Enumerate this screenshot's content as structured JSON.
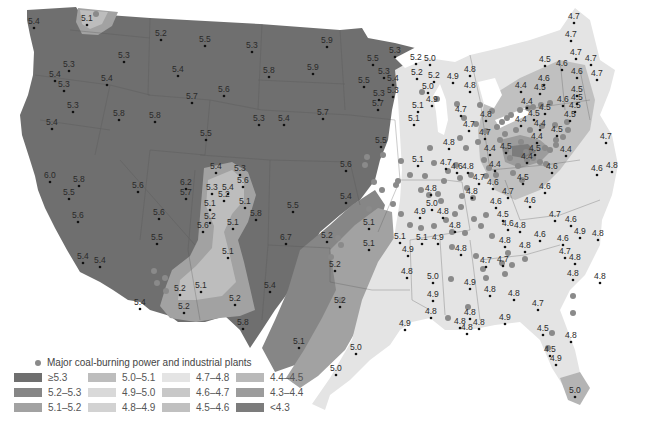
{
  "figure": {
    "type": "choropleth-map"
  },
  "legend": {
    "plant_marker_label": "Major coal-burning power and industrial plants",
    "plant_marker_color": "#8a8a8a",
    "classes": [
      {
        "label": "≥5.3",
        "color": "#6f6f6f"
      },
      {
        "label": "5.2–5.3",
        "color": "#868686"
      },
      {
        "label": "5.1–5.2",
        "color": "#a2a2a2"
      },
      {
        "label": "5.0–5.1",
        "color": "#bdbdbd"
      },
      {
        "label": "4.9–5.0",
        "color": "#d9d9d9"
      },
      {
        "label": "4.8–4.9",
        "color": "#d2d2d2"
      },
      {
        "label": "4.7–4.8",
        "color": "#e4e4e4"
      },
      {
        "label": "4.6–4.7",
        "color": "#c8c8c8"
      },
      {
        "label": "4.5–4.6",
        "color": "#c0c0c0"
      },
      {
        "label": "4.4–4.5",
        "color": "#b9b9b9"
      },
      {
        "label": "4.3–4.4",
        "color": "#9c9c9c"
      },
      {
        "label": "<4.3",
        "color": "#7c7c7c"
      }
    ]
  },
  "stations": [
    {
      "x": 34,
      "y": 20,
      "v": "5.4"
    },
    {
      "x": 87,
      "y": 17,
      "v": "5.1"
    },
    {
      "x": 124,
      "y": 54,
      "v": "5.3"
    },
    {
      "x": 69,
      "y": 63,
      "v": "5.3"
    },
    {
      "x": 55,
      "y": 73,
      "v": "5.4"
    },
    {
      "x": 64,
      "y": 83,
      "v": "5.3"
    },
    {
      "x": 107,
      "y": 77,
      "v": "5.4"
    },
    {
      "x": 73,
      "y": 104,
      "v": "5.3"
    },
    {
      "x": 52,
      "y": 121,
      "v": "5.4"
    },
    {
      "x": 119,
      "y": 112,
      "v": "5.8"
    },
    {
      "x": 155,
      "y": 114,
      "v": "5.8"
    },
    {
      "x": 161,
      "y": 32,
      "v": "5.2"
    },
    {
      "x": 205,
      "y": 38,
      "v": "5.5"
    },
    {
      "x": 178,
      "y": 68,
      "v": "5.4"
    },
    {
      "x": 192,
      "y": 95,
      "v": "5.7"
    },
    {
      "x": 206,
      "y": 132,
      "v": "5.5"
    },
    {
      "x": 252,
      "y": 44,
      "v": "5.3"
    },
    {
      "x": 224,
      "y": 88,
      "v": "5.6"
    },
    {
      "x": 269,
      "y": 69,
      "v": "5.8"
    },
    {
      "x": 259,
      "y": 117,
      "v": "5.3"
    },
    {
      "x": 327,
      "y": 39,
      "v": "5.9"
    },
    {
      "x": 313,
      "y": 66,
      "v": "5.9"
    },
    {
      "x": 284,
      "y": 117,
      "v": "5.4"
    },
    {
      "x": 323,
      "y": 111,
      "v": "5.7"
    },
    {
      "x": 373,
      "y": 57,
      "v": "5.5"
    },
    {
      "x": 384,
      "y": 70,
      "v": "5.3"
    },
    {
      "x": 364,
      "y": 79,
      "v": "5.5"
    },
    {
      "x": 379,
      "y": 92,
      "v": "5.3"
    },
    {
      "x": 378,
      "y": 102,
      "v": "5.7"
    },
    {
      "x": 395,
      "y": 49,
      "v": "5.3"
    },
    {
      "x": 393,
      "y": 77,
      "v": "5.4"
    },
    {
      "x": 393,
      "y": 89,
      "v": "5.3"
    },
    {
      "x": 416,
      "y": 56,
      "v": "5.2"
    },
    {
      "x": 430,
      "y": 57,
      "v": "5.0"
    },
    {
      "x": 417,
      "y": 71,
      "v": "5.2"
    },
    {
      "x": 434,
      "y": 74,
      "v": "5.2"
    },
    {
      "x": 453,
      "y": 75,
      "v": "4.9"
    },
    {
      "x": 470,
      "y": 68,
      "v": "4.8"
    },
    {
      "x": 470,
      "y": 84,
      "v": "4.8"
    },
    {
      "x": 428,
      "y": 85,
      "v": "5.0"
    },
    {
      "x": 432,
      "y": 98,
      "v": "4.9"
    },
    {
      "x": 418,
      "y": 104,
      "v": "5.1"
    },
    {
      "x": 414,
      "y": 117,
      "v": "5.1"
    },
    {
      "x": 381,
      "y": 139,
      "v": "5.5"
    },
    {
      "x": 461,
      "y": 108,
      "v": "4.7"
    },
    {
      "x": 469,
      "y": 123,
      "v": "4.7"
    },
    {
      "x": 486,
      "y": 113,
      "v": "4.8"
    },
    {
      "x": 485,
      "y": 131,
      "v": "4.7"
    },
    {
      "x": 490,
      "y": 147,
      "v": "4.4"
    },
    {
      "x": 506,
      "y": 145,
      "v": "4.5"
    },
    {
      "x": 495,
      "y": 163,
      "v": "4.4"
    },
    {
      "x": 527,
      "y": 155,
      "v": "4.4"
    },
    {
      "x": 574,
      "y": 15,
      "v": "4.7"
    },
    {
      "x": 571,
      "y": 33,
      "v": "4.7"
    },
    {
      "x": 576,
      "y": 51,
      "v": "4.7"
    },
    {
      "x": 591,
      "y": 57,
      "v": "4.7"
    },
    {
      "x": 597,
      "y": 72,
      "v": "4.7"
    },
    {
      "x": 577,
      "y": 70,
      "v": "4.6"
    },
    {
      "x": 577,
      "y": 88,
      "v": "4.5"
    },
    {
      "x": 562,
      "y": 62,
      "v": "4.6"
    },
    {
      "x": 545,
      "y": 58,
      "v": "4.5"
    },
    {
      "x": 544,
      "y": 77,
      "v": "4.6"
    },
    {
      "x": 540,
      "y": 86,
      "v": "4.5"
    },
    {
      "x": 575,
      "y": 104,
      "v": "4.5"
    },
    {
      "x": 563,
      "y": 98,
      "v": "4.6"
    },
    {
      "x": 570,
      "y": 113,
      "v": "4.5"
    },
    {
      "x": 577,
      "y": 96,
      "v": "4.5"
    },
    {
      "x": 545,
      "y": 106,
      "v": "4.5"
    },
    {
      "x": 521,
      "y": 84,
      "v": "4.4"
    },
    {
      "x": 527,
      "y": 100,
      "v": "4.4"
    },
    {
      "x": 534,
      "y": 112,
      "v": "4.5"
    },
    {
      "x": 521,
      "y": 118,
      "v": "4.4"
    },
    {
      "x": 540,
      "y": 122,
      "v": "4.4"
    },
    {
      "x": 557,
      "y": 128,
      "v": "4.5"
    },
    {
      "x": 606,
      "y": 135,
      "v": "4.7"
    },
    {
      "x": 612,
      "y": 164,
      "v": "4.8"
    },
    {
      "x": 597,
      "y": 167,
      "v": "4.6"
    },
    {
      "x": 537,
      "y": 135,
      "v": "4.4"
    },
    {
      "x": 566,
      "y": 148,
      "v": "4.4"
    },
    {
      "x": 552,
      "y": 165,
      "v": "4.6"
    },
    {
      "x": 535,
      "y": 147,
      "v": "4.5"
    },
    {
      "x": 523,
      "y": 176,
      "v": "4.5"
    },
    {
      "x": 530,
      "y": 199,
      "v": "4.6"
    },
    {
      "x": 545,
      "y": 185,
      "v": "4.6"
    },
    {
      "x": 555,
      "y": 213,
      "v": "4.7"
    },
    {
      "x": 571,
      "y": 218,
      "v": "4.6"
    },
    {
      "x": 540,
      "y": 233,
      "v": "4.6"
    },
    {
      "x": 563,
      "y": 237,
      "v": "4.6"
    },
    {
      "x": 580,
      "y": 230,
      "v": "4.9"
    },
    {
      "x": 598,
      "y": 232,
      "v": "4.8"
    },
    {
      "x": 565,
      "y": 250,
      "v": "4.7"
    },
    {
      "x": 575,
      "y": 256,
      "v": "4.8"
    },
    {
      "x": 525,
      "y": 244,
      "v": "4.8"
    },
    {
      "x": 505,
      "y": 239,
      "v": "4.8"
    },
    {
      "x": 573,
      "y": 272,
      "v": "4.8"
    },
    {
      "x": 600,
      "y": 275,
      "v": "4.8"
    },
    {
      "x": 468,
      "y": 165,
      "v": "4.8"
    },
    {
      "x": 479,
      "y": 176,
      "v": "4.7"
    },
    {
      "x": 457,
      "y": 165,
      "v": "4.6"
    },
    {
      "x": 472,
      "y": 190,
      "v": "4.8"
    },
    {
      "x": 493,
      "y": 181,
      "v": "4.6"
    },
    {
      "x": 508,
      "y": 190,
      "v": "4.7"
    },
    {
      "x": 496,
      "y": 200,
      "v": "4.6"
    },
    {
      "x": 503,
      "y": 213,
      "v": "4.5"
    },
    {
      "x": 508,
      "y": 222,
      "v": "4.6"
    },
    {
      "x": 520,
      "y": 224,
      "v": "4.8"
    },
    {
      "x": 449,
      "y": 141,
      "v": "4.8"
    },
    {
      "x": 446,
      "y": 161,
      "v": "4.7"
    },
    {
      "x": 418,
      "y": 158,
      "v": "5.1"
    },
    {
      "x": 431,
      "y": 187,
      "v": "4.8"
    },
    {
      "x": 432,
      "y": 202,
      "v": "5.0"
    },
    {
      "x": 420,
      "y": 210,
      "v": "4.9"
    },
    {
      "x": 443,
      "y": 210,
      "v": "4.8"
    },
    {
      "x": 455,
      "y": 224,
      "v": "4.8"
    },
    {
      "x": 400,
      "y": 235,
      "v": "5.1"
    },
    {
      "x": 422,
      "y": 236,
      "v": "5.1"
    },
    {
      "x": 438,
      "y": 236,
      "v": "4.9"
    },
    {
      "x": 461,
      "y": 247,
      "v": "4.8"
    },
    {
      "x": 486,
      "y": 259,
      "v": "4.7"
    },
    {
      "x": 503,
      "y": 258,
      "v": "4.7"
    },
    {
      "x": 407,
      "y": 270,
      "v": "4.8"
    },
    {
      "x": 408,
      "y": 248,
      "v": "4.9"
    },
    {
      "x": 433,
      "y": 275,
      "v": "5.0"
    },
    {
      "x": 433,
      "y": 293,
      "v": "4.9"
    },
    {
      "x": 431,
      "y": 310,
      "v": "4.8"
    },
    {
      "x": 470,
      "y": 281,
      "v": "4.9"
    },
    {
      "x": 490,
      "y": 288,
      "v": "4.8"
    },
    {
      "x": 514,
      "y": 292,
      "v": "4.8"
    },
    {
      "x": 538,
      "y": 302,
      "v": "4.7"
    },
    {
      "x": 470,
      "y": 311,
      "v": "4.8"
    },
    {
      "x": 505,
      "y": 316,
      "v": "4.9"
    },
    {
      "x": 479,
      "y": 321,
      "v": "4.8"
    },
    {
      "x": 460,
      "y": 320,
      "v": "4.8"
    },
    {
      "x": 467,
      "y": 326,
      "v": "4.8"
    },
    {
      "x": 543,
      "y": 327,
      "v": "4.5"
    },
    {
      "x": 571,
      "y": 334,
      "v": "4.8"
    },
    {
      "x": 550,
      "y": 348,
      "v": "4.5"
    },
    {
      "x": 556,
      "y": 357,
      "v": "4.9"
    },
    {
      "x": 575,
      "y": 389,
      "v": "5.0"
    },
    {
      "x": 405,
      "y": 322,
      "v": "4.9"
    },
    {
      "x": 356,
      "y": 346,
      "v": "5.0"
    },
    {
      "x": 336,
      "y": 367,
      "v": "5.0"
    },
    {
      "x": 299,
      "y": 340,
      "v": "5.1"
    },
    {
      "x": 340,
      "y": 299,
      "v": "5.2"
    },
    {
      "x": 335,
      "y": 263,
      "v": "5.2"
    },
    {
      "x": 327,
      "y": 234,
      "v": "5.2"
    },
    {
      "x": 369,
      "y": 221,
      "v": "5.1"
    },
    {
      "x": 369,
      "y": 242,
      "v": "5.1"
    },
    {
      "x": 346,
      "y": 195,
      "v": "5.4"
    },
    {
      "x": 293,
      "y": 204,
      "v": "5.5"
    },
    {
      "x": 346,
      "y": 163,
      "v": "5.6"
    },
    {
      "x": 286,
      "y": 236,
      "v": "6.7"
    },
    {
      "x": 270,
      "y": 284,
      "v": "5.4"
    },
    {
      "x": 243,
      "y": 321,
      "v": "5.8"
    },
    {
      "x": 235,
      "y": 297,
      "v": "5.2"
    },
    {
      "x": 228,
      "y": 250,
      "v": "5.1"
    },
    {
      "x": 201,
      "y": 284,
      "v": "5.1"
    },
    {
      "x": 256,
      "y": 212,
      "v": "5.8"
    },
    {
      "x": 224,
      "y": 193,
      "v": "5.2"
    },
    {
      "x": 243,
      "y": 179,
      "v": "5.6"
    },
    {
      "x": 240,
      "y": 167,
      "v": "5.3"
    },
    {
      "x": 216,
      "y": 165,
      "v": "5.4"
    },
    {
      "x": 212,
      "y": 186,
      "v": "5.3"
    },
    {
      "x": 228,
      "y": 186,
      "v": "5.4"
    },
    {
      "x": 210,
      "y": 202,
      "v": "5.1"
    },
    {
      "x": 245,
      "y": 200,
      "v": "5.1"
    },
    {
      "x": 210,
      "y": 215,
      "v": "5.2"
    },
    {
      "x": 233,
      "y": 221,
      "v": "5.1"
    },
    {
      "x": 203,
      "y": 224,
      "v": "5.6"
    },
    {
      "x": 186,
      "y": 191,
      "v": "5.7"
    },
    {
      "x": 186,
      "y": 181,
      "v": "6.2"
    },
    {
      "x": 159,
      "y": 211,
      "v": "5.6"
    },
    {
      "x": 138,
      "y": 184,
      "v": "5.6"
    },
    {
      "x": 157,
      "y": 236,
      "v": "5.5"
    },
    {
      "x": 79,
      "y": 178,
      "v": "5.8"
    },
    {
      "x": 50,
      "y": 174,
      "v": "6.0"
    },
    {
      "x": 69,
      "y": 191,
      "v": "5.5"
    },
    {
      "x": 78,
      "y": 214,
      "v": "5.6"
    },
    {
      "x": 83,
      "y": 255,
      "v": "5.4"
    },
    {
      "x": 100,
      "y": 259,
      "v": "5.4"
    },
    {
      "x": 140,
      "y": 301,
      "v": "5.4"
    },
    {
      "x": 180,
      "y": 287,
      "v": "5.2"
    },
    {
      "x": 184,
      "y": 305,
      "v": "5.2"
    }
  ],
  "plants": [
    [
      96,
      14
    ],
    [
      457,
      104
    ],
    [
      437,
      99
    ],
    [
      422,
      92
    ],
    [
      464,
      118
    ],
    [
      476,
      124
    ],
    [
      492,
      111
    ],
    [
      480,
      105
    ],
    [
      486,
      131
    ],
    [
      497,
      127
    ],
    [
      502,
      122
    ],
    [
      507,
      118
    ],
    [
      511,
      115
    ],
    [
      520,
      110
    ],
    [
      528,
      108
    ],
    [
      533,
      107
    ],
    [
      541,
      105
    ],
    [
      550,
      103
    ],
    [
      516,
      130
    ],
    [
      505,
      134
    ],
    [
      500,
      140
    ],
    [
      506,
      150
    ],
    [
      510,
      158
    ],
    [
      521,
      142
    ],
    [
      526,
      152
    ],
    [
      533,
      158
    ],
    [
      540,
      162
    ],
    [
      546,
      164
    ],
    [
      550,
      150
    ],
    [
      556,
      145
    ],
    [
      563,
      137
    ],
    [
      568,
      130
    ],
    [
      527,
      160
    ],
    [
      518,
      166
    ],
    [
      513,
      173
    ],
    [
      522,
      180
    ],
    [
      545,
      148
    ],
    [
      556,
      140
    ],
    [
      460,
      138
    ],
    [
      466,
      148
    ],
    [
      478,
      142
    ],
    [
      484,
      160
    ],
    [
      489,
      168
    ],
    [
      496,
      175
    ],
    [
      471,
      175
    ],
    [
      467,
      188
    ],
    [
      462,
      196
    ],
    [
      461,
      207
    ],
    [
      455,
      214
    ],
    [
      446,
      220
    ],
    [
      441,
      201
    ],
    [
      444,
      181
    ],
    [
      448,
      171
    ],
    [
      438,
      194
    ],
    [
      429,
      195
    ],
    [
      421,
      190
    ],
    [
      425,
      176
    ],
    [
      430,
      148
    ],
    [
      434,
      163
    ],
    [
      410,
      175
    ],
    [
      396,
      185
    ],
    [
      382,
      190
    ],
    [
      374,
      182
    ],
    [
      383,
      155
    ],
    [
      393,
      204
    ],
    [
      401,
      214
    ],
    [
      410,
      225
    ],
    [
      421,
      228
    ],
    [
      434,
      226
    ],
    [
      452,
      232
    ],
    [
      465,
      233
    ],
    [
      474,
      219
    ],
    [
      481,
      226
    ],
    [
      486,
      215
    ],
    [
      492,
      236
    ],
    [
      476,
      256
    ],
    [
      483,
      269
    ],
    [
      486,
      278
    ],
    [
      505,
      274
    ],
    [
      508,
      253
    ],
    [
      502,
      263
    ],
    [
      512,
      265
    ],
    [
      525,
      259
    ],
    [
      451,
      279
    ],
    [
      468,
      307
    ],
    [
      448,
      318
    ],
    [
      486,
      176
    ],
    [
      473,
      198
    ],
    [
      552,
      333
    ],
    [
      548,
      348
    ],
    [
      573,
      296
    ],
    [
      573,
      313
    ],
    [
      567,
      122
    ],
    [
      555,
      125
    ],
    [
      542,
      126
    ],
    [
      530,
      130
    ],
    [
      367,
      157
    ],
    [
      365,
      165
    ],
    [
      452,
      247
    ],
    [
      369,
      209
    ],
    [
      398,
      181
    ],
    [
      456,
      165
    ],
    [
      460,
      178
    ],
    [
      154,
      271
    ],
    [
      157,
      283
    ],
    [
      165,
      278
    ],
    [
      166,
      291
    ],
    [
      341,
      300
    ],
    [
      331,
      257
    ],
    [
      341,
      245
    ],
    [
      338,
      238
    ],
    [
      401,
      161
    ]
  ],
  "special_labels": [
    {
      "x": 513,
      "y": 153,
      "v": "4.3"
    },
    {
      "x": 430,
      "y": 208,
      "v": "<4.3"
    }
  ]
}
